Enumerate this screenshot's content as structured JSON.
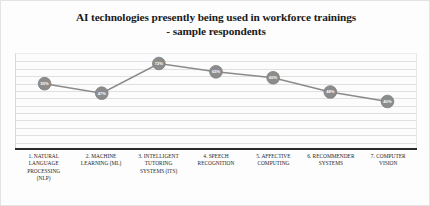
{
  "chart_data": {
    "type": "line",
    "title": "AI technologies presently being used in workforce trainings - sample respondents",
    "title_lines": [
      "AI technologies presently being used in workforce trainings",
      "- sample respondents"
    ],
    "xlabel": "",
    "ylabel": "",
    "ylim": [
      0,
      80
    ],
    "grid": true,
    "legend": false,
    "marker_shape": "circle",
    "marker_color": "#8c8c8c",
    "line_color": "#8a8a8a",
    "label_color": "#ffffff",
    "categories": [
      "1. NATURAL LANGUAGE PROCESSING (NLP)",
      "2. MACHINE LEARNING (ML)",
      "3. INTELLIGENT TUTORING SYSTEMS (ITS)",
      "4. SPEECH RECOGNITION",
      "5. AFFECTIVE COMPUTING",
      "6. RECOMMENDER SYSTEMS",
      "7. COMPUTER VISION"
    ],
    "category_lines": [
      [
        "1. NATURAL",
        "LANGUAGE",
        "PROCESSING",
        "(NLP)"
      ],
      [
        "2. MACHINE",
        "LEARNING (ML)"
      ],
      [
        "3. INTELLIGENT",
        "TUTORING",
        "SYSTEMS (ITS)"
      ],
      [
        "4. SPEECH",
        "RECOGNITION"
      ],
      [
        "5. AFFECTIVE",
        "COMPUTING"
      ],
      [
        "6. RECOMMENDER",
        "SYSTEMS"
      ],
      [
        "7. COMPUTER",
        "VISION"
      ]
    ],
    "values": [
      55,
      47,
      72,
      65,
      60,
      48,
      40
    ],
    "point_labels": [
      "55%",
      "47%",
      "72%",
      "65%",
      "60%",
      "48%",
      "40%"
    ]
  }
}
